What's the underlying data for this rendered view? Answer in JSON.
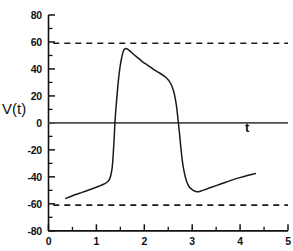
{
  "chart_data": {
    "type": "line",
    "title": "",
    "subtitle": "",
    "xlabel": "t",
    "ylabel": "V(t)",
    "xlim": [
      0,
      5
    ],
    "ylim": [
      -80,
      80
    ],
    "grid": false,
    "legend": null,
    "x_ticks": [
      0,
      1,
      2,
      3,
      4,
      5
    ],
    "x_tick_labels": [
      "0",
      "1",
      "2",
      "3",
      "4",
      "5"
    ],
    "x_minor_ticks": [
      0.5,
      1.5,
      2.5,
      3.5,
      4.5
    ],
    "y_ticks": [
      -80,
      -60,
      -40,
      -20,
      0,
      20,
      40,
      60,
      80
    ],
    "y_tick_labels": [
      "-80",
      "-60",
      "-40",
      "-20",
      "0",
      "20",
      "40",
      "60",
      "80"
    ],
    "y_minor_ticks": [
      -70,
      -50,
      -30,
      -10,
      10,
      30,
      50,
      70
    ],
    "series": [
      {
        "name": "V(t)",
        "style": "solid",
        "color": "#1a1a1a",
        "points": [
          [
            0.36,
            -56.0
          ],
          [
            0.5,
            -54.0
          ],
          [
            0.7,
            -51.5
          ],
          [
            0.9,
            -49.0
          ],
          [
            1.05,
            -47.0
          ],
          [
            1.15,
            -45.5
          ],
          [
            1.22,
            -44.0
          ],
          [
            1.27,
            -42.0
          ],
          [
            1.3,
            -39.0
          ],
          [
            1.33,
            -33.0
          ],
          [
            1.35,
            -24.0
          ],
          [
            1.37,
            -12.0
          ],
          [
            1.39,
            2.0
          ],
          [
            1.42,
            16.0
          ],
          [
            1.45,
            28.0
          ],
          [
            1.48,
            38.0
          ],
          [
            1.52,
            47.0
          ],
          [
            1.56,
            53.0
          ],
          [
            1.6,
            55.0
          ],
          [
            1.66,
            54.5
          ],
          [
            1.74,
            52.0
          ],
          [
            1.84,
            49.0
          ],
          [
            1.96,
            45.5
          ],
          [
            2.08,
            42.5
          ],
          [
            2.2,
            39.5
          ],
          [
            2.32,
            37.0
          ],
          [
            2.44,
            34.0
          ],
          [
            2.52,
            31.0
          ],
          [
            2.58,
            27.0
          ],
          [
            2.63,
            21.0
          ],
          [
            2.67,
            13.0
          ],
          [
            2.7,
            4.0
          ],
          [
            2.73,
            -6.0
          ],
          [
            2.76,
            -17.0
          ],
          [
            2.79,
            -27.0
          ],
          [
            2.83,
            -36.0
          ],
          [
            2.88,
            -43.0
          ],
          [
            2.94,
            -47.5
          ],
          [
            3.02,
            -50.0
          ],
          [
            3.1,
            -51.0
          ],
          [
            3.18,
            -50.5
          ],
          [
            3.3,
            -49.0
          ],
          [
            3.5,
            -46.5
          ],
          [
            3.7,
            -44.0
          ],
          [
            3.9,
            -41.5
          ],
          [
            4.1,
            -39.5
          ],
          [
            4.32,
            -37.5
          ]
        ]
      },
      {
        "name": "upper threshold",
        "style": "dashed",
        "color": "#1a1a1a",
        "constant_y": 59,
        "x_from": 0.1,
        "x_to": 5.0
      },
      {
        "name": "lower threshold",
        "style": "dashed",
        "color": "#1a1a1a",
        "constant_y": -61,
        "x_from": 0.1,
        "x_to": 5.0
      },
      {
        "name": "zero axis",
        "style": "solid",
        "color": "#4d4d4d",
        "constant_y": 0,
        "x_from": 0.0,
        "x_to": 5.0
      }
    ],
    "annotations": [
      {
        "name": "y-axis-title",
        "text": "V(t)"
      },
      {
        "name": "x-axis-title",
        "text": "t"
      }
    ]
  },
  "axes": {
    "y_title": "V(t)",
    "x_title": "t",
    "y_labels": [
      "80",
      "60",
      "40",
      "20",
      "0",
      "-20",
      "-40",
      "-60",
      "-80"
    ],
    "x_labels": [
      "0",
      "1",
      "2",
      "3",
      "4",
      "5"
    ]
  },
  "colors": {
    "curve": "#1a1a1a",
    "axis": "#111111",
    "zero_line": "#4d4d4d",
    "background": "#ffffff"
  }
}
